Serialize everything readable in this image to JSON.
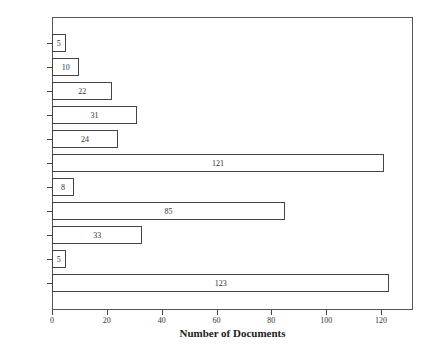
{
  "chart_data": {
    "type": "bar",
    "orientation": "horizontal",
    "title": "",
    "xlabel": "Number of Documents",
    "ylabel": "",
    "xlim": [
      0,
      131.7
    ],
    "xticks": [
      0,
      20,
      40,
      60,
      80,
      100,
      120
    ],
    "grid": false,
    "legend": null,
    "categories": [
      "Other",
      "Education",
      "Libraries",
      "NGOs",
      "Scholars",
      "Technology",
      "News",
      "Elected",
      "Appointed",
      "Lawyers",
      "Media"
    ],
    "values": [
      5,
      10,
      22,
      31,
      24,
      121,
      8,
      85,
      33,
      5,
      123
    ],
    "data_labels": [
      "5",
      "10",
      "22",
      "31",
      "24",
      "121",
      "8",
      "85",
      "33",
      "5",
      "123"
    ]
  },
  "layout": {
    "plot_left": 52,
    "plot_right": 413,
    "plot_top": 17,
    "plot_bottom": 310,
    "px_per_unit": 2.742,
    "first_bar_center": 43,
    "bar_pitch": 24,
    "bar_height": 18
  }
}
